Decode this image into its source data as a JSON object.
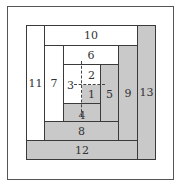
{
  "diagram": {
    "colors": {
      "light": "#ffffff",
      "dark": "#c9c9c9",
      "line": "#3a3a3a"
    },
    "pieces": [
      {
        "id": "1",
        "label": "1",
        "shade": "dark"
      },
      {
        "id": "2",
        "label": "2",
        "shade": "light"
      },
      {
        "id": "3",
        "label": "3",
        "shade": "light"
      },
      {
        "id": "4",
        "label": "4",
        "shade": "dark"
      },
      {
        "id": "5",
        "label": "5",
        "shade": "dark"
      },
      {
        "id": "6",
        "label": "6",
        "shade": "light"
      },
      {
        "id": "7",
        "label": "7",
        "shade": "light"
      },
      {
        "id": "8",
        "label": "8",
        "shade": "dark"
      },
      {
        "id": "9",
        "label": "9",
        "shade": "dark"
      },
      {
        "id": "10",
        "label": "10",
        "shade": "light"
      },
      {
        "id": "11",
        "label": "11",
        "shade": "light"
      },
      {
        "id": "12",
        "label": "12",
        "shade": "dark"
      },
      {
        "id": "13",
        "label": "13",
        "shade": "dark"
      }
    ]
  }
}
